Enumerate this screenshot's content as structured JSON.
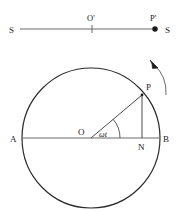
{
  "figure": {
    "name": "shm-reference-circle",
    "background_color": "#ffffff",
    "stroke_color": "#2b2b2b",
    "line_color": "#555555",
    "label_color": "#1a1a1a"
  },
  "top_line": {
    "label_left_s": "S",
    "label_right_s": "S",
    "label_origin": "O'",
    "label_projection": "P'",
    "line_y": 29,
    "line_x_start": 20,
    "line_x_end": 158,
    "tick_x": 92,
    "point_x": 155
  },
  "circle": {
    "center_label": "O",
    "label_left": "A",
    "label_right": "B",
    "label_foot": "N",
    "label_particle": "P",
    "angle_label": "ωt",
    "center_x": 91,
    "center_y": 138,
    "radius_x": 69,
    "radius_y": 70,
    "particle_x": 142,
    "particle_y": 95,
    "foot_x": 142,
    "foot_y": 138
  },
  "arrow": {
    "name": "rotation-direction-arrow",
    "direction": "counterclockwise"
  }
}
